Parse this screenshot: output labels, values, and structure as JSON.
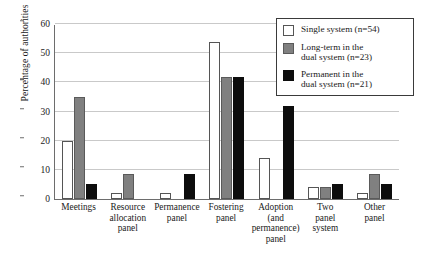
{
  "chart_data": {
    "type": "bar",
    "title": "",
    "xlabel": "",
    "ylabel": "Percentage of authorities",
    "ylim": [
      0,
      60
    ],
    "yticks": [
      0,
      10,
      20,
      30,
      40,
      50,
      60
    ],
    "grid": true,
    "legend_position": "top-right",
    "categories": [
      "Meetings",
      "Resource allocation panel",
      "Permanence panel",
      "Fostering panel",
      "Adoption (and permanence) panel",
      "Two panel system",
      "Other panel"
    ],
    "category_lines": [
      [
        "Meetings"
      ],
      [
        "Resource",
        "allocation",
        "panel"
      ],
      [
        "Permanence",
        "panel"
      ],
      [
        "Fostering",
        "panel"
      ],
      [
        "Adoption (and",
        "permanence)",
        "panel"
      ],
      [
        "Two",
        "panel",
        "system"
      ],
      [
        "Other",
        "panel"
      ]
    ],
    "series": [
      {
        "name": "Single system (n=54)",
        "legend_lines": [
          "Single system (n=54)"
        ],
        "color": "#ffffff",
        "key": "single",
        "values": [
          20,
          2,
          2,
          54,
          14,
          4,
          2
        ]
      },
      {
        "name": "Long-term in the dual system (n=23)",
        "legend_lines": [
          "Long-term in the",
          "dual system (n=23)"
        ],
        "color": "#808080",
        "key": "longterm",
        "values": [
          35,
          8.5,
          0,
          42,
          0,
          4,
          8.5
        ]
      },
      {
        "name": "Permanent in the dual system (n=21)",
        "legend_lines": [
          "Permanent in the",
          "dual system (n=21)"
        ],
        "color": "#0d0d0d",
        "key": "permanent",
        "values": [
          5,
          0,
          8.5,
          42,
          32,
          5,
          5
        ]
      }
    ]
  }
}
